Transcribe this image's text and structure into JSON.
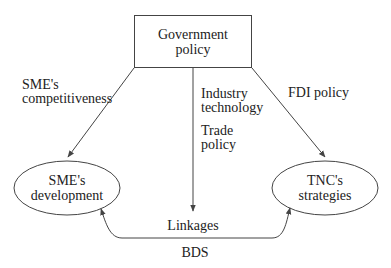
{
  "diagram": {
    "nodes": {
      "government": {
        "line1": "Government",
        "line2": "policy",
        "shape": "rectangle"
      },
      "sme": {
        "line1": "SME's",
        "line2": "development",
        "shape": "ellipse"
      },
      "tnc": {
        "line1": "TNC's",
        "line2": "strategies",
        "shape": "ellipse"
      }
    },
    "edges": {
      "left": {
        "line1": "SME's",
        "line2": "competitiveness",
        "from": "Government policy",
        "to": "SME's development"
      },
      "middle": {
        "line1": "Industry",
        "line2": "technology",
        "line3": "Trade",
        "line4": "policy",
        "from": "Government policy",
        "to": "Linkages"
      },
      "right": {
        "label": "FDI policy",
        "from": "Government policy",
        "to": "TNC's strategies"
      },
      "bottom": {
        "label": "BDS",
        "from": "SME's development",
        "to": "TNC's strategies",
        "bidirectional": true
      }
    },
    "linkages_label": "Linkages",
    "colors": {
      "stroke": "#444444",
      "text": "#222222",
      "background": "#ffffff"
    }
  }
}
